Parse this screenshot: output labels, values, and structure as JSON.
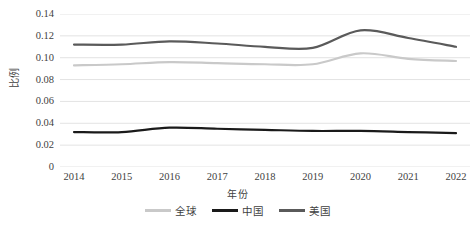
{
  "chart_data": {
    "type": "line",
    "title": "",
    "xlabel": "年份",
    "ylabel": "比例",
    "x": [
      2014,
      2015,
      2016,
      2017,
      2018,
      2019,
      2020,
      2021,
      2022
    ],
    "xticklabels": [
      "2014",
      "2015",
      "2016",
      "2017",
      "2018",
      "2019",
      "2020",
      "2021",
      "2022"
    ],
    "yticklabels": [
      "0",
      "0.02",
      "0.04",
      "0.06",
      "0.08",
      "0.10",
      "0.12",
      "0.14"
    ],
    "ytickvalues": [
      0,
      0.02,
      0.04,
      0.06,
      0.08,
      0.1,
      0.12,
      0.14
    ],
    "ylim": [
      0,
      0.14
    ],
    "xlim": [
      2014,
      2022
    ],
    "grid": "horizontal",
    "legend_position": "bottom",
    "smoothing": "spline",
    "series": [
      {
        "name": "全球",
        "color": "#c9c9c9",
        "values": [
          0.093,
          0.094,
          0.096,
          0.095,
          0.094,
          0.094,
          0.104,
          0.099,
          0.097
        ]
      },
      {
        "name": "中国",
        "color": "#1a1a1a",
        "values": [
          0.032,
          0.032,
          0.036,
          0.035,
          0.034,
          0.033,
          0.033,
          0.032,
          0.031
        ]
      },
      {
        "name": "美国",
        "color": "#5a5a5a",
        "values": [
          0.112,
          0.112,
          0.115,
          0.113,
          0.11,
          0.109,
          0.125,
          0.118,
          0.11
        ]
      }
    ]
  },
  "axes": {
    "y_title": "比例",
    "x_title": "年份"
  },
  "colors": {
    "gridline": "#e3e3e3",
    "text": "#3f3f3f",
    "background": "#ffffff"
  }
}
